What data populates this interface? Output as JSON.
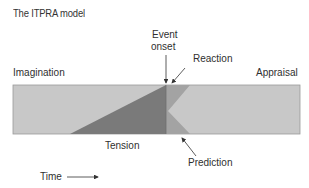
{
  "title": "The ITPRA model",
  "labels": {
    "imagination": "Imagination",
    "appraisal": "Appraisal",
    "event_onset_line1": "Event",
    "event_onset_line2": "onset",
    "reaction": "Reaction",
    "tension": "Tension",
    "prediction": "Prediction",
    "time": "Time"
  },
  "colors": {
    "light": "#c8c8c8",
    "medium": "#a3a3a3",
    "dark": "#7a7a7a",
    "border": "#9a9a9a",
    "arrow": "#333333"
  }
}
